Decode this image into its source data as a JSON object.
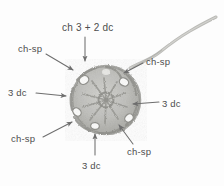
{
  "figure": {
    "type": "crochet-motif-diagram",
    "background_color": "#fdfdfd",
    "text_color": "#4e4e4e",
    "yarn_color": "#9a9a96",
    "motif": {
      "center_x": 106,
      "center_y": 100,
      "radius": 34,
      "chain_space_holes": 6
    },
    "tail": {
      "description": "yarn tail curving from motif top-right to upper-right corner"
    }
  },
  "annotations": [
    {
      "id": "top-center",
      "label": "ch 3 + 2 dc",
      "label_x": 62,
      "label_y": 23,
      "arrow_direction": "down",
      "arrow": {
        "x1": 85,
        "y1": 37,
        "x2": 85,
        "y2": 61
      }
    },
    {
      "id": "upper-left",
      "label": "ch-sp",
      "label_x": 18,
      "label_y": 44,
      "arrow_direction": "down-right",
      "arrow": {
        "x1": 46,
        "y1": 54,
        "x2": 73,
        "y2": 70
      }
    },
    {
      "id": "upper-right",
      "label": "ch-sp",
      "label_x": 146,
      "label_y": 57,
      "arrow_direction": "down-left",
      "arrow": {
        "x1": 143,
        "y1": 63,
        "x2": 124,
        "y2": 73
      }
    },
    {
      "id": "left",
      "label": "3 dc",
      "label_x": 8,
      "label_y": 88,
      "arrow_direction": "right",
      "arrow": {
        "x1": 36,
        "y1": 93,
        "x2": 66,
        "y2": 96
      }
    },
    {
      "id": "right",
      "label": "3 dc",
      "label_x": 162,
      "label_y": 99,
      "arrow_direction": "left",
      "arrow": {
        "x1": 159,
        "y1": 102,
        "x2": 133,
        "y2": 104
      }
    },
    {
      "id": "lower-left",
      "label": "ch-sp",
      "label_x": 11,
      "label_y": 134,
      "arrow_direction": "up-right",
      "arrow": {
        "x1": 43,
        "y1": 137,
        "x2": 72,
        "y2": 122
      }
    },
    {
      "id": "lower-right",
      "label": "ch-sp",
      "label_x": 127,
      "label_y": 147,
      "arrow_direction": "up-left",
      "arrow": {
        "x1": 133,
        "y1": 144,
        "x2": 119,
        "y2": 125
      }
    },
    {
      "id": "bottom-center",
      "label": "3 dc",
      "label_x": 82,
      "label_y": 161,
      "arrow_direction": "up",
      "arrow": {
        "x1": 95,
        "y1": 155,
        "x2": 95,
        "y2": 134
      }
    }
  ]
}
